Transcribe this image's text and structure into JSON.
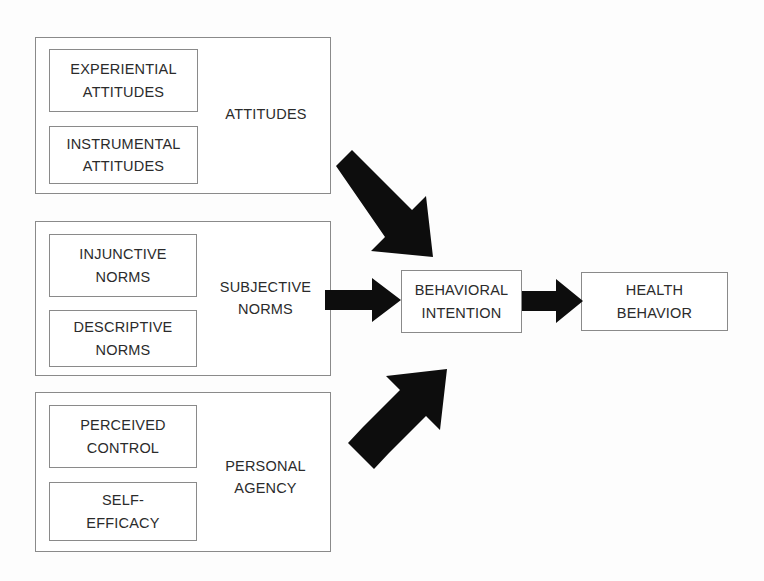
{
  "diagram": {
    "background_color": "#fdfdfd",
    "line_color": "#8a8a8a",
    "text_color": "#2b2b2b",
    "arrow_color": "#0d0d0d"
  },
  "groups": [
    {
      "id": "attitudes",
      "title": "ATTITUDES",
      "sub_boxes": [
        {
          "id": "experiential-attitudes",
          "label": "EXPERIENTIAL\nATTITUDES"
        },
        {
          "id": "instrumental-attitudes",
          "label": "INSTRUMENTAL\nATTITUDES"
        }
      ]
    },
    {
      "id": "subjective-norms",
      "title": "SUBJECTIVE\nNORMS",
      "sub_boxes": [
        {
          "id": "injunctive-norms",
          "label": "INJUNCTIVE\nNORMS"
        },
        {
          "id": "descriptive-norms",
          "label": "DESCRIPTIVE\nNORMS"
        }
      ]
    },
    {
      "id": "personal-agency",
      "title": "PERSONAL\nAGENCY",
      "sub_boxes": [
        {
          "id": "perceived-control",
          "label": "PERCEIVED\nCONTROL"
        },
        {
          "id": "self-efficacy",
          "label": "SELF-\nEFFICACY"
        }
      ]
    }
  ],
  "nodes": [
    {
      "id": "behavioral-intention",
      "label": "BEHAVIORAL\nINTENTION"
    },
    {
      "id": "health-behavior",
      "label": "HEALTH\nBEHAVIOR"
    }
  ],
  "arrows": [
    {
      "id": "attitudes-to-intention",
      "from": "attitudes",
      "to": "behavioral-intention",
      "direction": "down-right"
    },
    {
      "id": "subjective-norms-to-intention",
      "from": "subjective-norms",
      "to": "behavioral-intention",
      "direction": "right"
    },
    {
      "id": "personal-agency-to-intention",
      "from": "personal-agency",
      "to": "behavioral-intention",
      "direction": "up-right"
    },
    {
      "id": "intention-to-behavior",
      "from": "behavioral-intention",
      "to": "health-behavior",
      "direction": "right"
    }
  ]
}
